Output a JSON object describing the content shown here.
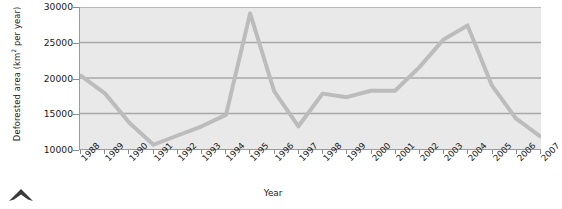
{
  "chart_data": {
    "type": "line",
    "title": "",
    "xlabel": "Year",
    "ylabel": "Deforested area (km² per year)",
    "ylabel_main": "Deforested area (km",
    "ylabel_sup": "2",
    "ylabel_tail": " per year)",
    "categories": [
      "1988",
      "1989",
      "1990",
      "1991",
      "1992",
      "1993",
      "1994",
      "1995",
      "1996",
      "1997",
      "1998",
      "1999",
      "2000",
      "2001",
      "2002",
      "2003",
      "2004",
      "2005",
      "2006",
      "2007"
    ],
    "x": [
      1988,
      1989,
      1990,
      1991,
      1992,
      1993,
      1994,
      1995,
      1996,
      1997,
      1998,
      1999,
      2000,
      2001,
      2002,
      2003,
      2004,
      2005,
      2006,
      2007
    ],
    "values": [
      20300,
      17800,
      13700,
      10600,
      11900,
      13200,
      14800,
      29100,
      18100,
      13200,
      17800,
      17300,
      18200,
      18200,
      21500,
      25400,
      27400,
      19000,
      14300,
      11800
    ],
    "series": [
      {
        "name": "Deforested area",
        "color": "#bcbcbc",
        "values": [
          20300,
          17800,
          13700,
          10600,
          11900,
          13200,
          14800,
          29100,
          18100,
          13200,
          17800,
          17300,
          18200,
          18200,
          21500,
          25400,
          27400,
          19000,
          14300,
          11800
        ]
      }
    ],
    "yticks": [
      10000,
      15000,
      20000,
      25000,
      30000
    ],
    "ytick_labels": [
      "10000",
      "15000",
      "20000",
      "25000",
      "30000"
    ],
    "ylim": [
      10000,
      30000
    ],
    "xlim": [
      1988,
      2007
    ],
    "grid": true,
    "grid_axis": "y",
    "legend": false,
    "legend_position": "none",
    "plot_background": "#e9e9e9",
    "grid_color": "#a9a9a9",
    "axis_color": "#9a9a9a",
    "line_color": "#bcbcbc",
    "line_width": 4
  }
}
